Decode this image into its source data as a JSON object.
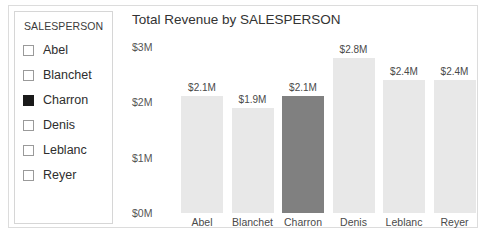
{
  "slicer": {
    "header": "SALESPERSON",
    "items": [
      {
        "label": "Abel",
        "checked": false
      },
      {
        "label": "Blanchet",
        "checked": false
      },
      {
        "label": "Charron",
        "checked": true
      },
      {
        "label": "Denis",
        "checked": false
      },
      {
        "label": "Leblanc",
        "checked": false
      },
      {
        "label": "Reyer",
        "checked": false
      }
    ]
  },
  "chart": {
    "title": "Total Revenue by SALESPERSON"
  },
  "colors": {
    "bar_default": "#e8e8e8",
    "bar_highlight": "#808080",
    "axis_text": "#555555",
    "title_text": "#333333",
    "panel_border": "#d6d6d6",
    "frame_border": "#dcdcdc"
  },
  "chart_data": {
    "type": "bar",
    "title": "Total Revenue by SALESPERSON",
    "xlabel": "",
    "ylabel": "",
    "categories": [
      "Abel",
      "Blanchet",
      "Charron",
      "Denis",
      "Leblanc",
      "Reyer"
    ],
    "values": [
      2.1,
      1.9,
      2.1,
      2.8,
      2.4,
      2.4
    ],
    "data_labels": [
      "$2.1M",
      "$1.9M",
      "$2.1M",
      "$2.8M",
      "$2.4M",
      "$2.4M"
    ],
    "highlighted": [
      "Charron"
    ],
    "ylim": [
      0,
      3
    ],
    "ytick_values": [
      3,
      2,
      1,
      0
    ],
    "ytick_labels": [
      "$3M",
      "$2M",
      "$1M",
      "$0M"
    ],
    "grid": false,
    "legend": false,
    "units": "millions of dollars"
  }
}
